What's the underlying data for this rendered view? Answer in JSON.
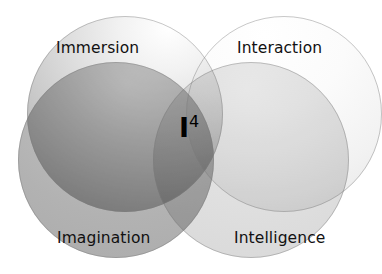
{
  "diagram": {
    "type": "venn",
    "background_color": "#ffffff",
    "center_mark": {
      "base": "I",
      "exponent": "4",
      "full_text": "I4",
      "color": "#000000"
    },
    "circles": [
      {
        "id": "immersion",
        "label": "Immersion",
        "position": "top-left",
        "fill_start": "#ffffff",
        "fill_end": "#9b9b9b",
        "label_color": "#111111"
      },
      {
        "id": "interaction",
        "label": "Interaction",
        "position": "top-right",
        "fill_start": "#ffffff",
        "fill_end": "#dddddd",
        "label_color": "#111111"
      },
      {
        "id": "imagination",
        "label": "Imagination",
        "position": "bottom-left",
        "fill_start": "#c9c9c9",
        "fill_end": "#a6a6a6",
        "label_color": "#111111"
      },
      {
        "id": "intelligence",
        "label": "Intelligence",
        "position": "bottom-right",
        "fill_start": "#eaeaea",
        "fill_end": "#d2d2d2",
        "label_color": "#111111"
      }
    ]
  }
}
